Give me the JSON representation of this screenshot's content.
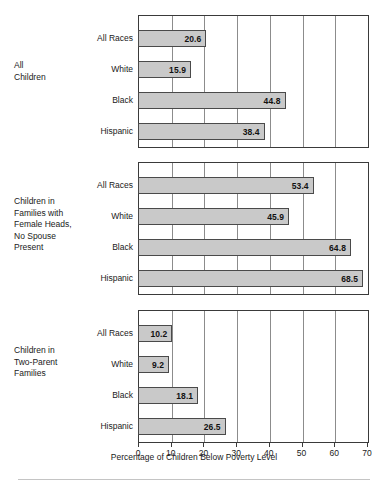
{
  "chart_data": {
    "type": "bar",
    "orientation": "horizontal",
    "title": "",
    "xlabel": "Percentage of Children Below Poverty Level",
    "ylabel": "",
    "xlim": [
      0,
      70
    ],
    "xticks": [
      0,
      10,
      20,
      30,
      40,
      50,
      60,
      70
    ],
    "xtick_labels": [
      "0",
      "10",
      "20",
      "30",
      "40",
      "50",
      "60",
      "70"
    ],
    "grid": true,
    "legend": null,
    "categories": [
      "All Races",
      "White",
      "Black",
      "Hispanic"
    ],
    "panels": [
      {
        "label": "All\nChildren",
        "label_lines": [
          "All",
          "Children"
        ],
        "categories": [
          "All Races",
          "White",
          "Black",
          "Hispanic"
        ],
        "values": [
          20.6,
          15.9,
          44.8,
          38.4
        ],
        "value_labels": [
          "20.6",
          "15.9",
          "44.8",
          "38.4"
        ]
      },
      {
        "label": "Children in\nFamilies with\nFemale Heads,\nNo Spouse\nPresent",
        "label_lines": [
          "Children in",
          "Families with",
          "Female Heads,",
          "No Spouse",
          "Present"
        ],
        "categories": [
          "All Races",
          "White",
          "Black",
          "Hispanic"
        ],
        "values": [
          53.4,
          45.9,
          64.8,
          68.5
        ],
        "value_labels": [
          "53.4",
          "45.9",
          "64.8",
          "68.5"
        ]
      },
      {
        "label": "Children in\nTwo-Parent\nFamilies",
        "label_lines": [
          "Children in",
          "Two-Parent",
          "Families"
        ],
        "categories": [
          "All Races",
          "White",
          "Black",
          "Hispanic"
        ],
        "values": [
          10.2,
          9.2,
          18.1,
          26.5
        ],
        "value_labels": [
          "10.2",
          "9.2",
          "18.1",
          "26.5"
        ]
      }
    ],
    "colors": {
      "bar_fill": "#c9c9c9",
      "bar_border": "#4a4a4a",
      "axis": "#3a3a3a",
      "gridline": "#8c8c8c",
      "text": "#1a1a1a",
      "background": "#ffffff"
    }
  }
}
